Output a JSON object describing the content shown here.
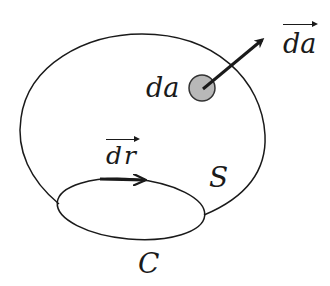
{
  "diagram": {
    "title": "",
    "colors": {
      "stroke": "#1a1a1a",
      "area_element_fill": "#b8b8b8",
      "background": "#ffffff"
    },
    "surface": {
      "label": "S"
    },
    "boundary_curve": {
      "label": "C"
    },
    "area_element": {
      "label": "da"
    },
    "normal_vector": {
      "label": "da",
      "is_vector": true
    },
    "line_element": {
      "label": "dr",
      "is_vector": true
    }
  }
}
